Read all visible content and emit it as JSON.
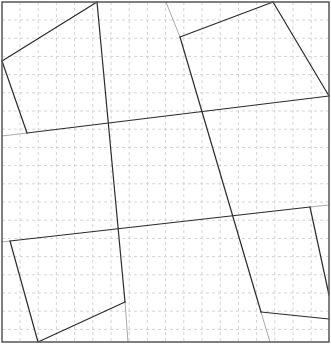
{
  "diagram": {
    "width": 331,
    "height": 349,
    "background": "#ffffff",
    "frame": {
      "x": 2,
      "y": 2,
      "w": 327,
      "h": 340,
      "color": "#555555",
      "width": 1.5
    },
    "grid": {
      "spacing": 18.2,
      "origin_x": 20,
      "origin_y": 20,
      "color": "#d4d4d4",
      "dash": "3,3"
    },
    "colors": {
      "dark": "#2b2b2b",
      "light": "#aaaaaa"
    },
    "dark_segments": [
      {
        "name": "tl-quad-top-edge",
        "x1": 2,
        "y1": 61,
        "x2": 97,
        "y2": 2
      },
      {
        "name": "tl-quad-left-edge",
        "x1": 2,
        "y1": 61,
        "x2": 27,
        "y2": 133
      },
      {
        "name": "upper-cross-line",
        "x1": 27,
        "y1": 133,
        "x2": 329,
        "y2": 96
      },
      {
        "name": "left-vertical-line",
        "x1": 97,
        "y1": 2,
        "x2": 125,
        "y2": 302
      },
      {
        "name": "tr-quad-top-edge",
        "x1": 180,
        "y1": 37,
        "x2": 273,
        "y2": 2
      },
      {
        "name": "tr-quad-right-edge",
        "x1": 273,
        "y1": 2,
        "x2": 329,
        "y2": 96
      },
      {
        "name": "right-vertical-line",
        "x1": 180,
        "y1": 37,
        "x2": 261,
        "y2": 312
      },
      {
        "name": "lower-cross-line",
        "x1": 10,
        "y1": 241,
        "x2": 310,
        "y2": 207
      },
      {
        "name": "bl-quad-left-edge",
        "x1": 10,
        "y1": 241,
        "x2": 38,
        "y2": 342
      },
      {
        "name": "bl-quad-bottom-edge",
        "x1": 38,
        "y1": 342,
        "x2": 125,
        "y2": 302
      },
      {
        "name": "br-quad-right-edge",
        "x1": 310,
        "y1": 207,
        "x2": 329,
        "y2": 295
      },
      {
        "name": "br-quad-bottom-edge",
        "x1": 261,
        "y1": 312,
        "x2": 329,
        "y2": 319
      }
    ],
    "light_segments": [
      {
        "name": "upper-cross-line-extension",
        "x1": 2,
        "y1": 136,
        "x2": 27,
        "y2": 133
      },
      {
        "name": "right-vertical-extension-top",
        "x1": 166,
        "y1": 2,
        "x2": 180,
        "y2": 37
      },
      {
        "name": "left-vertical-extension-bottom",
        "x1": 125,
        "y1": 302,
        "x2": 128,
        "y2": 342
      },
      {
        "name": "lower-cross-line-extension-left",
        "x1": 2,
        "y1": 242,
        "x2": 10,
        "y2": 241
      },
      {
        "name": "lower-cross-line-extension-right",
        "x1": 310,
        "y1": 207,
        "x2": 329,
        "y2": 205
      },
      {
        "name": "right-vertical-extension-bottom",
        "x1": 261,
        "y1": 312,
        "x2": 270,
        "y2": 342
      }
    ]
  }
}
